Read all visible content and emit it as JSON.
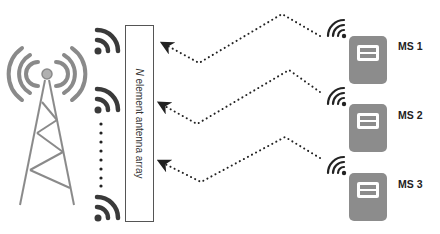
{
  "diagram": {
    "base_station": {
      "icon": "cell-tower-icon",
      "color": "#8a8a8a"
    },
    "antenna_array": {
      "label_italic": "N",
      "label_rest": " element antenna array",
      "element_icon": "wifi-icon",
      "element_color": "#3a3a3a",
      "elements_shown": 3,
      "ellipsis": "vertical-dots"
    },
    "mobile_stations": [
      {
        "label": "MS 1",
        "icon": "mobile-device-icon"
      },
      {
        "label": "MS 2",
        "icon": "mobile-device-icon"
      },
      {
        "label": "MS 3",
        "icon": "mobile-device-icon"
      }
    ],
    "signal_paths": {
      "style": "dotted",
      "direction": "MS to antenna array",
      "count": 3
    },
    "colors": {
      "device_body": "#8c8c8c",
      "device_screen": "#ffffff",
      "path": "#222222"
    }
  }
}
